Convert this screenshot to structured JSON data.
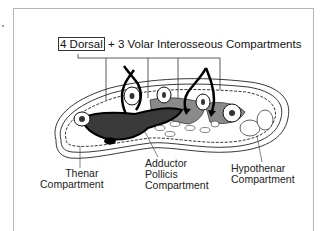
{
  "diagram": {
    "title": {
      "boxed_part": "4 Dorsal",
      "rest": "+ 3 Volar Interosseous Compartments"
    },
    "labels": {
      "thenar": [
        "Thenar",
        "Compartment"
      ],
      "adductor": [
        "Adductor",
        "Pollicis",
        "Compartment"
      ],
      "hypothenar": [
        "Hypothenar",
        "Compartment"
      ]
    },
    "colors": {
      "dark_compartment": "#3a3a3a",
      "mid_compartment": "#8a8a8a",
      "outline": "#111111",
      "frame": "#b9b6ae"
    }
  }
}
